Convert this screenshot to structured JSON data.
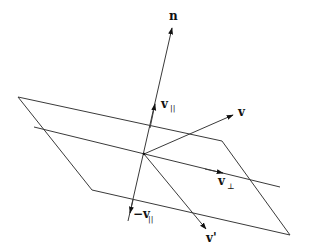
{
  "diagram": {
    "labels": {
      "normal": "n",
      "v": "v",
      "v_parallel": "v",
      "v_parallel_sub": "||",
      "v_perp": "v",
      "v_perp_sub": "⊥",
      "neg_v_parallel": "−v",
      "neg_v_parallel_sub": "||",
      "v_reflected": "v'"
    },
    "colors": {
      "line": "#3a3a3a",
      "text": "#111111",
      "background": "#ffffff"
    }
  }
}
